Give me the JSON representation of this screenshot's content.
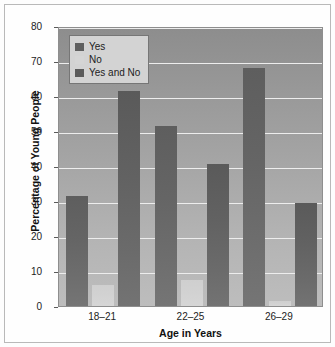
{
  "chart_data": {
    "type": "bar",
    "title": "",
    "xlabel": "Age in Years",
    "ylabel": "Percentage of Young People",
    "categories": [
      "18–21",
      "22–25",
      "26–29"
    ],
    "series": [
      {
        "name": "Yes",
        "values": [
          31.5,
          51.5,
          68.0
        ],
        "color": "#5f5f5f"
      },
      {
        "name": "No",
        "values": [
          6.0,
          7.5,
          1.5
        ],
        "color": "#d5d5d5"
      },
      {
        "name": "Yes and No",
        "values": [
          61.5,
          40.5,
          29.5
        ],
        "color": "#5b5b5b"
      }
    ],
    "ylim": [
      0,
      80
    ],
    "yticks": [
      0,
      10,
      20,
      30,
      40,
      50,
      60,
      70,
      80
    ],
    "ytick_labels": [
      "0",
      "10",
      "20",
      "30",
      "40",
      "50",
      "60",
      "70",
      "80"
    ],
    "grid": true,
    "legend_position": "upper-left",
    "plot_background": "#a6a6a6"
  },
  "legend": {
    "items": [
      {
        "label": "Yes"
      },
      {
        "label": "No"
      },
      {
        "label": "Yes and No"
      }
    ]
  },
  "axes": {
    "x_label": "Age in Years",
    "y_label": "Percentage of Young People",
    "x_tick_labels": [
      "18–21",
      "22–25",
      "26–29"
    ],
    "y_tick_labels": [
      "80",
      "70",
      "60",
      "50",
      "40",
      "30",
      "20",
      "10",
      "0"
    ]
  }
}
